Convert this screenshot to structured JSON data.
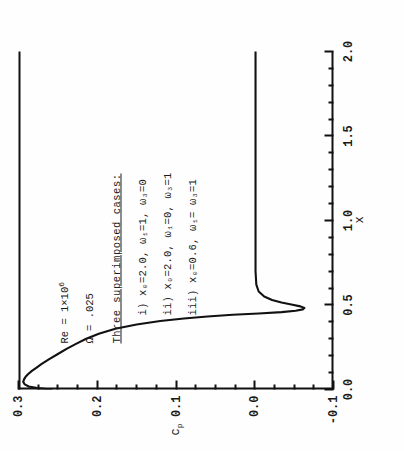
{
  "figure": {
    "note_title": "Three superimposed cases:",
    "params": [
      {
        "id": "reynolds",
        "text": "Re = 1×10",
        "exponent": "6"
      },
      {
        "id": "omega",
        "text": "Ω = .025",
        "exponent": ""
      }
    ],
    "cases": [
      {
        "label": "i)",
        "text": "x₀=2.0,  ω₁=1,  ω₃=0"
      },
      {
        "label": "ii)",
        "text": "x₀=2.0,  ω₁=0,  ω₃=1"
      },
      {
        "label": "iii)",
        "text": "x₀=0.6,  ω₁= ω₃=1"
      }
    ]
  },
  "chart_data": {
    "type": "line",
    "title": "",
    "xlabel": "x",
    "ylabel": "c_p",
    "ylabel_base": "c",
    "ylabel_sub": "p",
    "xlim": [
      0.0,
      2.0
    ],
    "ylim": [
      -0.1,
      0.3
    ],
    "grid": false,
    "legend": "none",
    "xticks": [
      0.0,
      0.5,
      1.0,
      1.5,
      2.0
    ],
    "xticklabels": [
      "0.0",
      "0.5",
      "1.0",
      "1.5",
      "2.0"
    ],
    "xminor_step": 0.1,
    "yticks": [
      -0.1,
      0.0,
      0.1,
      0.2,
      0.3
    ],
    "yticklabels": [
      "-0.1",
      "0.0",
      "0.1",
      "0.2",
      "0.3"
    ],
    "yminor_step": 0.025,
    "series": [
      {
        "name": "c_p (three superimposed cases)",
        "color": "#111111",
        "x": [
          0.0,
          0.008,
          0.018,
          0.03,
          0.045,
          0.06,
          0.075,
          0.09,
          0.11,
          0.13,
          0.15,
          0.18,
          0.21,
          0.24,
          0.27,
          0.3,
          0.33,
          0.36,
          0.385,
          0.405,
          0.42,
          0.432,
          0.442,
          0.45,
          0.458,
          0.466,
          0.474,
          0.482,
          0.492,
          0.502,
          0.515,
          0.53,
          0.55,
          0.58,
          0.62,
          0.7,
          0.8,
          1.0,
          1.2,
          1.4,
          1.6,
          1.8,
          2.0
        ],
        "y": [
          0.258,
          0.276,
          0.287,
          0.292,
          0.294,
          0.293,
          0.291,
          0.288,
          0.283,
          0.277,
          0.271,
          0.261,
          0.25,
          0.239,
          0.227,
          0.214,
          0.198,
          0.177,
          0.15,
          0.12,
          0.09,
          0.06,
          0.028,
          -0.005,
          -0.034,
          -0.052,
          -0.061,
          -0.063,
          -0.058,
          -0.048,
          -0.034,
          -0.022,
          -0.012,
          -0.005,
          -0.002,
          -0.001,
          -0.001,
          -0.001,
          -0.001,
          -0.001,
          -0.001,
          -0.001,
          -0.001
        ]
      }
    ],
    "annotations": [
      {
        "text": "Re = 1×10⁶"
      },
      {
        "text": "Ω = .025"
      },
      {
        "text": "Three superimposed cases:"
      },
      {
        "text": "i) x₀=2.0, ω₁=1, ω₃=0"
      },
      {
        "text": "ii) x₀=2.0, ω₁=0, ω₃=1"
      },
      {
        "text": "iii) x₀=0.6, ω₁= ω₃=1"
      }
    ]
  }
}
